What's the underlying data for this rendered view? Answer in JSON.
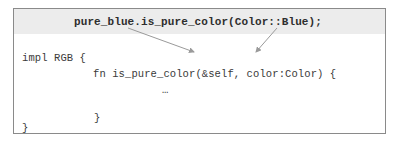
{
  "diagram": {
    "call_line": "pure_blue.is_pure_color(Color::Blue);",
    "code_lines": {
      "impl": "impl RGB {",
      "fn_signature": "fn is_pure_color(&self, color:Color) {",
      "body": "…",
      "inner_close": "}",
      "outer_close": "}"
    },
    "arrows": [
      {
        "from": "pure_blue",
        "to": "&self"
      },
      {
        "from": "Color::Blue",
        "to": "color:Color"
      }
    ],
    "colors": {
      "header_band": "#ececec",
      "border": "#8a8a8a",
      "text": "#3a3a3a",
      "arrow": "#9a9a9a"
    }
  }
}
